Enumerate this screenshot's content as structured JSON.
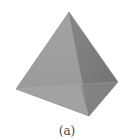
{
  "figure": {
    "caption": "(a)",
    "vertices": {
      "apex": [
        69,
        12
      ],
      "left": [
        16,
        89
      ],
      "front_bottom": [
        89,
        116
      ],
      "right": [
        118,
        82
      ]
    },
    "colors": {
      "front_face": "#9c9c9c",
      "front_face_lower": "#a9a9a9",
      "right_face": "#797979",
      "right_face_lower": "#8a8a8a",
      "background": "#ffffff"
    }
  }
}
